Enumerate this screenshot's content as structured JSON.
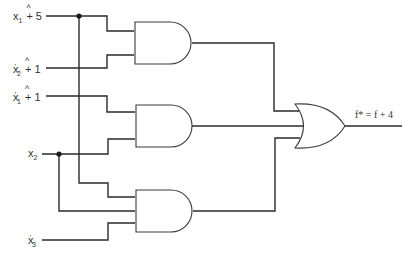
{
  "diagram": {
    "type": "logic-circuit",
    "inputs": [
      {
        "id": "in1",
        "var": "x",
        "sub": "1",
        "prime": false,
        "op": "+",
        "value": "5"
      },
      {
        "id": "in2",
        "var": "x",
        "sub": "2",
        "prime": true,
        "op": "+",
        "value": "1"
      },
      {
        "id": "in3",
        "var": "x",
        "sub": "1",
        "prime": true,
        "op": "+",
        "value": "1"
      },
      {
        "id": "in4",
        "var": "x",
        "sub": "2",
        "prime": false,
        "op": "",
        "value": ""
      },
      {
        "id": "in5",
        "var": "x",
        "sub": "3",
        "prime": true,
        "op": "",
        "value": ""
      }
    ],
    "gates": [
      {
        "id": "and1",
        "type": "AND",
        "inputs": 2
      },
      {
        "id": "and2",
        "type": "AND",
        "inputs": 2
      },
      {
        "id": "and3",
        "type": "AND",
        "inputs": 3
      },
      {
        "id": "or1",
        "type": "OR",
        "inputs": 3
      }
    ],
    "output": {
      "label": "f* = f + 4"
    },
    "colors": {
      "line": "#2a2a2a",
      "background": "#ffffff"
    }
  }
}
